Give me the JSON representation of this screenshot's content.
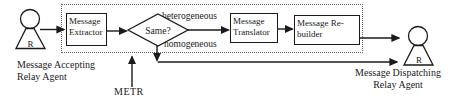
{
  "figure": {
    "agents": {
      "accepting": {
        "symbol": "R",
        "caption_line1": "Message Accepting",
        "caption_line2": "Relay Agent"
      },
      "dispatching": {
        "symbol": "R",
        "caption_line1": "Message Dispatching",
        "caption_line2": "Relay Agent"
      }
    },
    "process_boxes": {
      "extractor": {
        "line1": "Message",
        "line2": "Extractor"
      },
      "translator": {
        "line1": "Message",
        "line2": "Translator"
      },
      "rebuilder": {
        "line1": "Message Re-",
        "line2": "builder"
      }
    },
    "decision_diamond": {
      "label": "Same?"
    },
    "branch_labels": {
      "heterogeneous": "heterogeneous",
      "homogeneous": "homogeneous"
    },
    "metr": {
      "label": "METR"
    },
    "colors": {
      "ink": "#1a1a1a",
      "background": "#ffffff",
      "dotted_border": "#666666"
    }
  }
}
